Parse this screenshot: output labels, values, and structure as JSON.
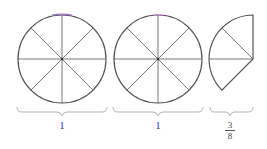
{
  "diagram": {
    "title": "",
    "shapes": [
      {
        "type": "full-circle",
        "divisions": 8,
        "label": "1"
      },
      {
        "type": "full-circle",
        "divisions": 8,
        "label": "1"
      },
      {
        "type": "partial-circle",
        "divisions_shown": 3,
        "total_divisions": 8,
        "label_numerator": "3",
        "label_denominator": "8"
      }
    ],
    "colors": {
      "stroke": "#444444",
      "brace": "#999999",
      "accent_top": "#b070c0"
    }
  }
}
